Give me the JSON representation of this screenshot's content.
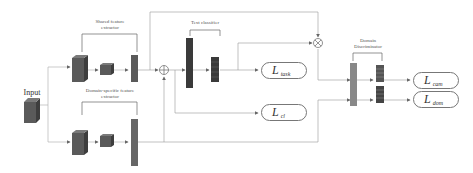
{
  "diagram": {
    "input_label": "Input",
    "shared_extractor_label": "Shared feature extractor",
    "domain_extractor_label": "Domain-specific feature extractor",
    "text_classifier_label": "Text classifier",
    "domain_discriminator_label": "Domain Discriminator",
    "losses": [
      {
        "symbol": "L",
        "subscript": "task"
      },
      {
        "symbol": "L",
        "subscript": "cl"
      },
      {
        "symbol": "L",
        "subscript": "cam"
      },
      {
        "symbol": "L",
        "subscript": "dom"
      }
    ],
    "operators": {
      "add": "⊕",
      "multiply": "⊗"
    },
    "colors": {
      "cube_dark": "#5a5a5a",
      "cube_side": "#3e3e3e",
      "cube_top": "#7a7a7a",
      "bar_dark": "#3a3a3a",
      "bar_mid": "#777777",
      "line": "#999999"
    }
  }
}
